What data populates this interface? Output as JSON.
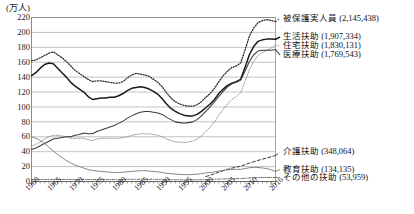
{
  "chart_data": {
    "type": "line",
    "title": "",
    "subtitle": "",
    "ylabel": "(万人)",
    "xlabel": "",
    "ylim": [
      0,
      220
    ],
    "ytick_step": 20,
    "grid": true,
    "legend_position": "inline-right",
    "xlim": [
      1960,
      2016
    ],
    "xtick_labels": [
      "1960",
      "1965",
      "1970",
      "1975",
      "1980",
      "1985",
      "1990",
      "1995",
      "2000",
      "2005",
      "2010",
      "2016"
    ],
    "xtick_values": [
      1960,
      1965,
      1970,
      1975,
      1980,
      1985,
      1990,
      1995,
      2000,
      2005,
      2010,
      2016
    ],
    "ytick_labels": [
      "0",
      "20",
      "40",
      "60",
      "80",
      "100",
      "120",
      "140",
      "160",
      "180",
      "200",
      "220"
    ],
    "ytick_values": [
      0,
      20,
      40,
      60,
      80,
      100,
      120,
      140,
      160,
      180,
      200,
      220
    ],
    "x": [
      1960,
      1961,
      1962,
      1963,
      1964,
      1965,
      1966,
      1967,
      1968,
      1969,
      1970,
      1971,
      1972,
      1973,
      1974,
      1975,
      1976,
      1977,
      1978,
      1979,
      1980,
      1981,
      1982,
      1983,
      1984,
      1985,
      1986,
      1987,
      1988,
      1989,
      1990,
      1991,
      1992,
      1993,
      1994,
      1995,
      1996,
      1997,
      1998,
      1999,
      2000,
      2001,
      2002,
      2003,
      2004,
      2005,
      2006,
      2007,
      2008,
      2009,
      2010,
      2011,
      2012,
      2013,
      2014,
      2015,
      2016
    ],
    "series": [
      {
        "name": "被保護実人員",
        "label": "被保護実人員 (2,145,438)",
        "value_label": "(2,145,438)",
        "style": "dotted",
        "color": "#2b2b2b",
        "values": [
          162,
          163,
          166,
          169,
          172,
          174,
          170,
          166,
          161,
          155,
          149,
          145,
          141,
          137,
          134,
          135,
          135,
          134,
          133,
          132,
          132,
          134,
          139,
          143,
          145,
          144,
          143,
          141,
          137,
          133,
          127,
          119,
          112,
          107,
          104,
          102,
          101,
          101,
          103,
          107,
          113,
          118,
          125,
          134,
          142,
          148,
          153,
          155,
          159,
          176,
          195,
          206,
          213,
          216,
          217,
          216,
          214.5
        ]
      },
      {
        "name": "生活扶助",
        "label": "生活扶助 (1,907,334)",
        "value_label": "(1,907,334)",
        "style": "solid-thick",
        "color": "#1a1a1a",
        "values": [
          142,
          146,
          152,
          157,
          159,
          158,
          152,
          146,
          140,
          133,
          128,
          124,
          120,
          114,
          110,
          111,
          112,
          112,
          113,
          113,
          115,
          118,
          122,
          125,
          126,
          127,
          126,
          124,
          121,
          117,
          111,
          104,
          98,
          94,
          91,
          89,
          88,
          88,
          90,
          94,
          99,
          104,
          110,
          118,
          124,
          129,
          132,
          134,
          137,
          153,
          170,
          181,
          188,
          190,
          191,
          191,
          190.7
        ]
      },
      {
        "name": "住宅扶助",
        "label": "住宅扶助 (1,830,131)",
        "value_label": "(1,830,131)",
        "style": "dotted-light",
        "color": "#8a8a8a",
        "values": [
          47,
          50,
          53,
          57,
          60,
          62,
          62,
          61,
          60,
          58,
          58,
          58,
          58,
          56,
          55,
          57,
          58,
          58,
          58,
          58,
          58,
          59,
          60,
          62,
          63,
          64,
          64,
          64,
          63,
          62,
          60,
          57,
          55,
          53,
          53,
          52,
          53,
          54,
          57,
          61,
          67,
          73,
          80,
          89,
          97,
          104,
          110,
          114,
          119,
          134,
          150,
          161,
          169,
          173,
          176,
          179,
          183
        ]
      },
      {
        "name": "医療扶助",
        "label": "医療扶助 (1,769,543)",
        "value_label": "(1,769,543)",
        "style": "solid-medium",
        "color": "#3a3a3a",
        "values": [
          43,
          45,
          48,
          51,
          54,
          57,
          58,
          59,
          60,
          60,
          62,
          63,
          65,
          64,
          64,
          67,
          69,
          71,
          73,
          75,
          78,
          81,
          85,
          88,
          91,
          93,
          94,
          94,
          93,
          92,
          90,
          86,
          83,
          80,
          79,
          78,
          79,
          80,
          83,
          88,
          94,
          100,
          107,
          114,
          121,
          127,
          131,
          133,
          136,
          148,
          161,
          170,
          175,
          176,
          176,
          176,
          177
        ]
      },
      {
        "name": "介護扶助",
        "label": "介護扶助 (348,064)",
        "value_label": "(348,064)",
        "style": "dashed",
        "color": "#2b2b2b",
        "values": [
          null,
          null,
          null,
          null,
          null,
          null,
          null,
          null,
          null,
          null,
          null,
          null,
          null,
          null,
          null,
          null,
          null,
          null,
          null,
          null,
          null,
          null,
          null,
          null,
          null,
          null,
          null,
          null,
          null,
          null,
          null,
          null,
          null,
          null,
          null,
          null,
          null,
          null,
          null,
          null,
          6.6,
          8.5,
          10.5,
          12.5,
          14.5,
          16.3,
          18.0,
          19.2,
          20.5,
          22.5,
          24.7,
          26.6,
          28.3,
          30.0,
          31.5,
          33.2,
          34.8
        ]
      },
      {
        "name": "教育扶助",
        "label": "教育扶助 (134,135)",
        "value_label": "(134,135)",
        "style": "solid-thin",
        "color": "#6a6a6a",
        "values": [
          60,
          58,
          55,
          51,
          46,
          41,
          36,
          32,
          28,
          25,
          22,
          20,
          18,
          16,
          15,
          14,
          13.5,
          13,
          12.5,
          12,
          12,
          12.5,
          13,
          13.5,
          14,
          14.5,
          14.5,
          14,
          13.5,
          13,
          12,
          11,
          10.5,
          10,
          9.5,
          9.2,
          9.2,
          9.4,
          9.8,
          10.5,
          11.5,
          12.2,
          13,
          14,
          15,
          15.8,
          16.2,
          16.2,
          16.3,
          17.3,
          18.5,
          18.9,
          18.8,
          18.2,
          17.2,
          15.8,
          13.4
        ]
      },
      {
        "name": "その他の扶助",
        "label": "その他の扶助 (53,959)",
        "value_label": "(53,959)",
        "style": "dash-dot",
        "color": "#555555",
        "values": [
          2.6,
          2.6,
          2.7,
          2.7,
          2.8,
          2.8,
          2.8,
          2.8,
          2.8,
          2.7,
          2.7,
          2.7,
          2.7,
          2.6,
          2.6,
          2.6,
          2.6,
          2.6,
          2.6,
          2.6,
          2.6,
          2.7,
          2.8,
          2.9,
          3.0,
          3.0,
          3.0,
          3.0,
          2.9,
          2.8,
          2.7,
          2.5,
          2.4,
          2.3,
          2.3,
          2.2,
          2.2,
          2.2,
          2.3,
          2.4,
          2.6,
          2.8,
          3.0,
          3.2,
          3.4,
          3.6,
          3.7,
          3.8,
          3.9,
          4.3,
          4.7,
          5.0,
          5.2,
          5.3,
          5.4,
          5.4,
          5.4
        ]
      }
    ],
    "annotations": []
  },
  "labels": {
    "top_group": [
      {
        "text": "被保護実人員 (2,145,438)"
      },
      {
        "text": "生活扶助 (1,907,334)"
      },
      {
        "text": "住宅扶助 (1,830,131)"
      },
      {
        "text": "医療扶助 (1,769,543)"
      }
    ],
    "bottom_group": [
      {
        "text": "介護扶助 (348,064)"
      },
      {
        "text": "教育扶助 (134,135)"
      },
      {
        "text": "その他の扶助 (53,959)"
      }
    ]
  }
}
